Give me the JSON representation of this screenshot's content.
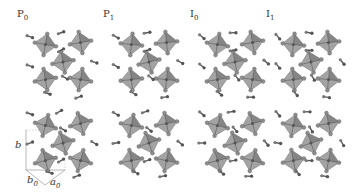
{
  "figure": {
    "panels": [
      {
        "id": "P0",
        "label_main": "P",
        "label_sub": "0",
        "x": 17,
        "label_x": 17
      },
      {
        "id": "P1",
        "label_main": "P",
        "label_sub": "1",
        "x": 103,
        "label_x": 103
      },
      {
        "id": "I0",
        "label_main": "I",
        "label_sub": "0",
        "x": 189,
        "label_x": 189
      },
      {
        "id": "I1",
        "label_main": "I",
        "label_sub": "1",
        "x": 265,
        "label_x": 265
      }
    ],
    "rows": [
      "top-view",
      "bottom-view"
    ],
    "axes": {
      "b": "b",
      "b0_main": "b",
      "b0_sub": "0",
      "a0_main": "a",
      "a0_sub": "0"
    },
    "colors": {
      "octahedron_fill": "#9a9a9a",
      "octahedron_dark": "#6e6e6e",
      "atom": "#8c8c8c",
      "molecule": "#555555"
    }
  }
}
